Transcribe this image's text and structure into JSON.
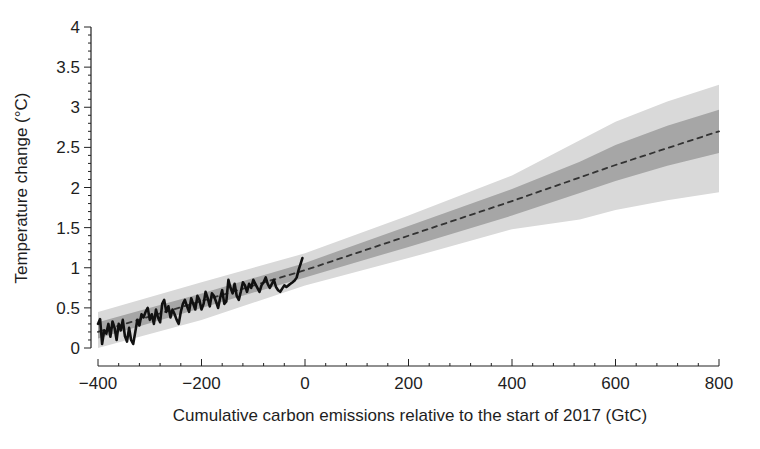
{
  "chart_data": {
    "type": "line",
    "title": "",
    "xlabel": "Cumulative carbon emissions relative to the start of 2017 (GtC)",
    "ylabel": "Temperature change (°C)",
    "xlim": [
      -400,
      800
    ],
    "ylim": [
      0,
      4
    ],
    "x_ticks": [
      -400,
      -200,
      0,
      200,
      400,
      600,
      800
    ],
    "x_tick_labels": [
      "−400",
      "−200",
      "0",
      "200",
      "400",
      "600",
      "800"
    ],
    "x_minor_tick_step": 40,
    "y_ticks": [
      0,
      0.5,
      1,
      1.5,
      2,
      2.5,
      3,
      3.5,
      4
    ],
    "y_tick_labels": [
      "0",
      "0.5",
      "1",
      "1.5",
      "2",
      "2.5",
      "3",
      "3.5",
      "4"
    ],
    "y_minor_tick_step": 0.1,
    "grid": false,
    "legend": null,
    "series": [
      {
        "name": "Observed temperature change",
        "style": "solid",
        "color": "#111111",
        "x": [
          -400,
          -396,
          -392,
          -388,
          -384,
          -380,
          -376,
          -372,
          -368,
          -364,
          -360,
          -356,
          -352,
          -348,
          -344,
          -340,
          -336,
          -332,
          -328,
          -324,
          -320,
          -316,
          -312,
          -308,
          -304,
          -300,
          -296,
          -292,
          -288,
          -284,
          -280,
          -276,
          -272,
          -268,
          -264,
          -260,
          -256,
          -252,
          -248,
          -244,
          -240,
          -236,
          -232,
          -228,
          -224,
          -220,
          -216,
          -212,
          -208,
          -204,
          -200,
          -196,
          -192,
          -188,
          -184,
          -180,
          -176,
          -172,
          -168,
          -164,
          -160,
          -156,
          -152,
          -148,
          -144,
          -140,
          -136,
          -132,
          -128,
          -124,
          -120,
          -116,
          -112,
          -108,
          -104,
          -100,
          -96,
          -92,
          -88,
          -84,
          -80,
          -76,
          -72,
          -68,
          -64,
          -60,
          -56,
          -52,
          -48,
          -44,
          -40,
          -36,
          -32,
          -28,
          -24,
          -20,
          -16,
          -12,
          -8,
          -5
        ],
        "y": [
          0.3,
          0.36,
          0.05,
          0.22,
          0.18,
          0.3,
          0.14,
          0.33,
          0.25,
          0.1,
          0.3,
          0.22,
          0.35,
          0.15,
          0.08,
          0.25,
          0.1,
          0.05,
          0.2,
          0.35,
          0.28,
          0.42,
          0.38,
          0.45,
          0.5,
          0.35,
          0.42,
          0.3,
          0.48,
          0.38,
          0.32,
          0.55,
          0.6,
          0.45,
          0.52,
          0.38,
          0.48,
          0.42,
          0.35,
          0.3,
          0.45,
          0.55,
          0.6,
          0.52,
          0.45,
          0.62,
          0.55,
          0.48,
          0.65,
          0.6,
          0.48,
          0.55,
          0.7,
          0.62,
          0.52,
          0.68,
          0.65,
          0.58,
          0.5,
          0.62,
          0.72,
          0.55,
          0.58,
          0.85,
          0.75,
          0.68,
          0.8,
          0.65,
          0.6,
          0.7,
          0.82,
          0.78,
          0.7,
          0.8,
          0.75,
          0.85,
          0.8,
          0.75,
          0.7,
          0.78,
          0.82,
          0.88,
          0.8,
          0.75,
          0.8,
          0.85,
          0.76,
          0.72,
          0.7,
          0.74,
          0.78,
          0.76,
          0.78,
          0.8,
          0.82,
          0.84,
          0.88,
          0.98,
          1.06,
          1.12
        ]
      },
      {
        "name": "Central estimate",
        "style": "dashed",
        "color": "#333333",
        "x": [
          -400,
          0,
          200,
          400,
          600,
          800
        ],
        "y": [
          0.2,
          0.97,
          1.4,
          1.83,
          2.28,
          2.7
        ]
      }
    ],
    "bands": [
      {
        "name": "Likely range (outer)",
        "color": "#d9d9d9",
        "x": [
          -400,
          -200,
          0,
          200,
          400,
          531,
          600,
          700,
          800
        ],
        "lower": [
          0.0,
          0.35,
          0.78,
          1.12,
          1.48,
          1.6,
          1.72,
          1.84,
          1.94
        ],
        "upper": [
          0.45,
          0.82,
          1.18,
          1.65,
          2.15,
          2.59,
          2.82,
          3.07,
          3.28
        ]
      },
      {
        "name": "Likely range (inner)",
        "color": "#a6a6a6",
        "x": [
          -400,
          -200,
          0,
          200,
          400,
          531,
          600,
          700,
          800
        ],
        "lower": [
          0.12,
          0.5,
          0.88,
          1.26,
          1.65,
          1.93,
          2.08,
          2.27,
          2.43
        ],
        "upper": [
          0.32,
          0.68,
          1.06,
          1.52,
          1.98,
          2.32,
          2.53,
          2.77,
          2.97
        ]
      }
    ]
  }
}
